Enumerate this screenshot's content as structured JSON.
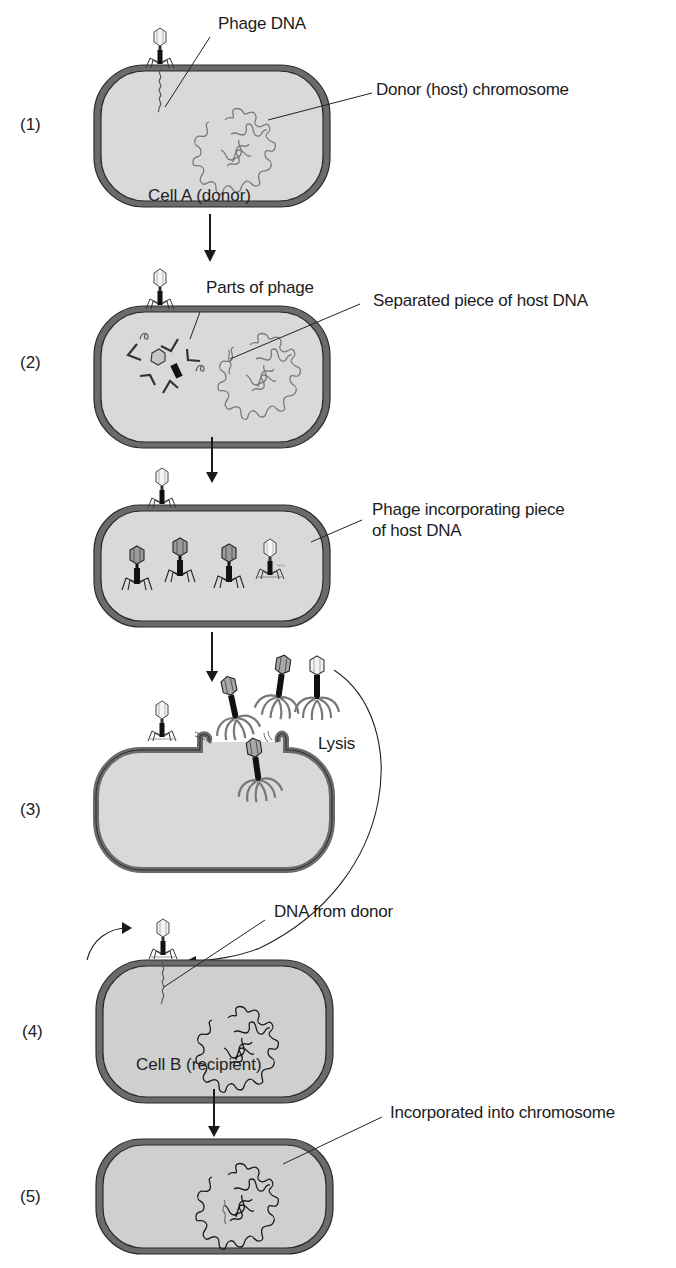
{
  "colors": {
    "cell_fill": "#d9d9d9",
    "cell_wall": "#6b6b6b",
    "cell_wall_dark": "#2a2a2a",
    "donor_dna": "#7a7a7a",
    "recipient_dna": "#1a1a1a",
    "arrow": "#1a1a1a"
  },
  "steps": [
    {
      "number": "(1)",
      "caption": "Cell A (donor)",
      "labels": [
        "Phage DNA",
        "Donor (host) chromosome"
      ]
    },
    {
      "number": "(2)",
      "labels": [
        "Parts of phage",
        "Separated piece of host DNA"
      ]
    },
    {
      "number": "",
      "labels": [
        "Phage incorporating piece",
        "of host DNA"
      ]
    },
    {
      "number": "(3)",
      "labels": [
        "Lysis"
      ]
    },
    {
      "number": "(4)",
      "caption": "Cell B (recipient)",
      "labels": [
        "DNA from donor"
      ]
    },
    {
      "number": "(5)",
      "labels": [
        "Incorporated into chromosome"
      ]
    }
  ]
}
